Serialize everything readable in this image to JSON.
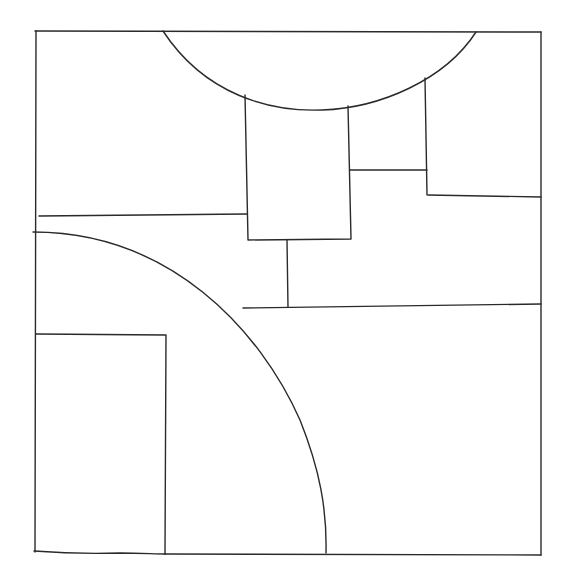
{
  "diagram": {
    "type": "hand-drawn line sketch",
    "background": "#ffffff",
    "stroke_color": "#2a2a2a",
    "outer_frame": {
      "x1": 36,
      "y1": 31,
      "x2": 541,
      "y2": 554
    },
    "shapes": [
      {
        "name": "top-semicircle-arc",
        "kind": "arc",
        "path": "M163,31 C205,95 270,112 322,110 C380,108 445,80 476,32"
      },
      {
        "name": "center-rectangle",
        "kind": "polyline",
        "points": "245,95 248,240 351,239 348,106"
      },
      {
        "name": "center-connector",
        "kind": "line",
        "x1": 350,
        "y1": 170,
        "x2": 427,
        "y2": 170
      },
      {
        "name": "right-step-vertical",
        "kind": "line",
        "x1": 425,
        "y1": 78,
        "x2": 427,
        "y2": 195
      },
      {
        "name": "right-step-horizontal",
        "kind": "line",
        "x1": 428,
        "y1": 195,
        "x2": 541,
        "y2": 197
      },
      {
        "name": "left-horizontal-line",
        "kind": "line",
        "x1": 39,
        "y1": 216,
        "x2": 247,
        "y2": 214
      },
      {
        "name": "lower-left-quarter-arc",
        "kind": "arc",
        "path": "M33,232 C170,232 260,330 300,420 C320,470 327,510 326,553"
      },
      {
        "name": "mid-vertical-line",
        "kind": "line",
        "x1": 287,
        "y1": 240,
        "x2": 288,
        "y2": 307
      },
      {
        "name": "mid-horizontal-line",
        "kind": "line",
        "x1": 243,
        "y1": 308,
        "x2": 541,
        "y2": 304
      },
      {
        "name": "bottom-left-rectangle",
        "kind": "polyline",
        "points": "36,334 166,335 165,554"
      },
      {
        "name": "bottom-left-wavy-base",
        "kind": "path",
        "path": "M34,551 C60,553 90,554 120,553 C140,553 155,554 165,554"
      }
    ]
  }
}
